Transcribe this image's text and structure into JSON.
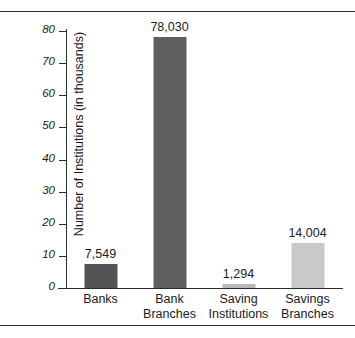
{
  "chart_data": {
    "type": "bar",
    "title": "",
    "xlabel": "",
    "ylabel": "Number of Institutions (in thousands)",
    "categories": [
      "Banks",
      "Bank Branches",
      "Saving Institutions",
      "Savings Branches"
    ],
    "category_lines": [
      [
        "Banks"
      ],
      [
        "Bank",
        "Branches"
      ],
      [
        "Saving",
        "Institutions"
      ],
      [
        "Savings",
        "Branches"
      ]
    ],
    "values": [
      7.549,
      78.03,
      1.294,
      14.004
    ],
    "data_labels": [
      "7,549",
      "78,030",
      "1,294",
      "14,004"
    ],
    "bar_colors": [
      "#545454",
      "#5e5e5e",
      "#b9b9b9",
      "#c9c9c9"
    ],
    "ylim": [
      0,
      80
    ],
    "yticks": [
      0,
      10,
      20,
      30,
      40,
      50,
      60,
      70,
      80
    ],
    "ytick_labels": [
      "0",
      "10",
      "20",
      "30",
      "40",
      "50",
      "60",
      "70",
      "80"
    ],
    "grid": false,
    "legend": false,
    "axis_color": "#2b2b2b"
  },
  "decoration": {
    "rule_color": "#2b2b2b"
  }
}
